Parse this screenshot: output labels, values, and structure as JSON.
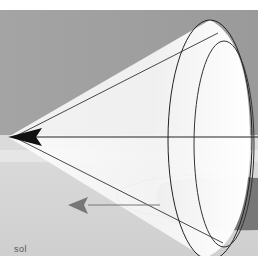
{
  "figure": {
    "label": "sol",
    "colors": {
      "sky": "#9a9a9a",
      "ground": "#d4d4d4",
      "cone": "#ffffff",
      "shadow": "#7a7a7a",
      "lines": "#222222",
      "arrow_gray": "#777777"
    }
  }
}
